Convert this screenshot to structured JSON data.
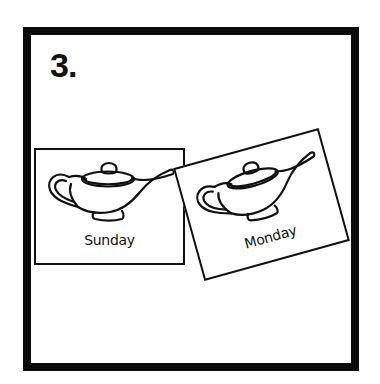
{
  "panel": {
    "number": "3."
  },
  "cards": [
    {
      "label": "Sunday",
      "icon": "oil-lamp-icon"
    },
    {
      "label": "Monday",
      "icon": "oil-lamp-icon"
    }
  ],
  "colors": {
    "ink": "#111111",
    "background": "#ffffff"
  }
}
